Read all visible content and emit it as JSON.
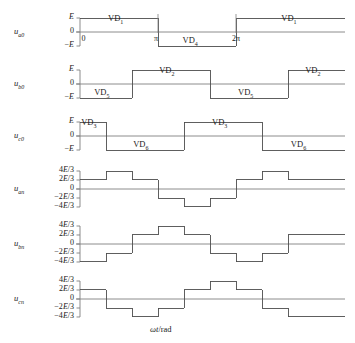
{
  "figure": {
    "xaxis_label": "ωt/rad",
    "xaxis_label_italic": "ωt",
    "xaxis_label_rest": "/rad",
    "x_ticks": [
      {
        "label": "0",
        "phase_deg": 0
      },
      {
        "label": "π",
        "phase_deg": 180
      },
      {
        "label": "2π",
        "phase_deg": 360
      }
    ],
    "geometry": {
      "x_origin_px": 80,
      "px_per_60deg": 26,
      "x_end_px": 345
    },
    "colors": {
      "trace": "#4d4d4d",
      "axis": "#808080",
      "text": "#1a1a1a",
      "background": "#ffffff"
    }
  },
  "chart_data": {
    "type": "line",
    "title": "",
    "xlabel": "ωt/rad",
    "ylabel": "",
    "grid": false,
    "legend": "none",
    "x_unit": "degrees",
    "x_range_deg": [
      0,
      612
    ],
    "plots": [
      {
        "name": "u_a0",
        "ylabel_base": "u",
        "ylabel_sub": "a0",
        "ytick_labels": [
          "E",
          "0",
          "−E"
        ],
        "ytick_values": [
          1,
          0,
          -1
        ],
        "ylim": [
          -1,
          1
        ],
        "unit": "E",
        "steps": [
          {
            "from_deg": 0,
            "to_deg": 180,
            "value": 1
          },
          {
            "from_deg": 180,
            "to_deg": 360,
            "value": -1
          },
          {
            "from_deg": 360,
            "to_deg": 612,
            "value": 1
          }
        ],
        "device_labels": [
          {
            "text": "VD",
            "sub": "1",
            "center_deg": 90,
            "level": "high"
          },
          {
            "text": "VD",
            "sub": "4",
            "center_deg": 262,
            "level": "low"
          },
          {
            "text": "VD",
            "sub": "1",
            "center_deg": 490,
            "level": "high"
          }
        ]
      },
      {
        "name": "u_b0",
        "ylabel_base": "u",
        "ylabel_sub": "b0",
        "ytick_labels": [
          "E",
          "0",
          "−E"
        ],
        "ytick_values": [
          1,
          0,
          -1
        ],
        "ylim": [
          -1,
          1
        ],
        "unit": "E",
        "steps": [
          {
            "from_deg": 0,
            "to_deg": 120,
            "value": -1
          },
          {
            "from_deg": 120,
            "to_deg": 300,
            "value": 1
          },
          {
            "from_deg": 300,
            "to_deg": 480,
            "value": -1
          },
          {
            "from_deg": 480,
            "to_deg": 612,
            "value": 1
          }
        ],
        "device_labels": [
          {
            "text": "VD",
            "sub": "5",
            "center_deg": 58,
            "level": "low"
          },
          {
            "text": "VD",
            "sub": "2",
            "center_deg": 208,
            "level": "high"
          },
          {
            "text": "VD",
            "sub": "5",
            "center_deg": 390,
            "level": "low"
          },
          {
            "text": "VD",
            "sub": "2",
            "center_deg": 545,
            "level": "high"
          }
        ]
      },
      {
        "name": "u_c0",
        "ylabel_base": "u",
        "ylabel_sub": "c0",
        "ytick_labels": [
          "E",
          "0",
          "−E"
        ],
        "ytick_values": [
          1,
          0,
          -1
        ],
        "ylim": [
          -1,
          1
        ],
        "unit": "E",
        "steps": [
          {
            "from_deg": 0,
            "to_deg": 60,
            "value": 1
          },
          {
            "from_deg": 60,
            "to_deg": 240,
            "value": -1
          },
          {
            "from_deg": 240,
            "to_deg": 420,
            "value": 1
          },
          {
            "from_deg": 420,
            "to_deg": 612,
            "value": -1
          }
        ],
        "device_labels": [
          {
            "text": "VD",
            "sub": "3",
            "center_deg": 28,
            "level": "high"
          },
          {
            "text": "VD",
            "sub": "6",
            "center_deg": 148,
            "level": "low"
          },
          {
            "text": "VD",
            "sub": "3",
            "center_deg": 330,
            "level": "high"
          },
          {
            "text": "VD",
            "sub": "6",
            "center_deg": 512,
            "level": "low"
          }
        ]
      },
      {
        "name": "u_an",
        "ylabel_base": "u",
        "ylabel_sub": "an",
        "ytick_labels": [
          "4E/3",
          "2E/3",
          "0",
          "−2E/3",
          "−4E/3"
        ],
        "ytick_values": [
          1.3333,
          0.6667,
          0,
          -0.6667,
          -1.3333
        ],
        "ylim": [
          -1.3333,
          1.3333
        ],
        "unit": "E",
        "steps": [
          {
            "from_deg": 0,
            "to_deg": 60,
            "value": 0.6667
          },
          {
            "from_deg": 60,
            "to_deg": 120,
            "value": 1.3333
          },
          {
            "from_deg": 120,
            "to_deg": 180,
            "value": 0.6667
          },
          {
            "from_deg": 180,
            "to_deg": 240,
            "value": -0.6667
          },
          {
            "from_deg": 240,
            "to_deg": 300,
            "value": -1.3333
          },
          {
            "from_deg": 300,
            "to_deg": 360,
            "value": -0.6667
          },
          {
            "from_deg": 360,
            "to_deg": 420,
            "value": 0.6667
          },
          {
            "from_deg": 420,
            "to_deg": 480,
            "value": 1.3333
          },
          {
            "from_deg": 480,
            "to_deg": 540,
            "value": 0.6667
          },
          {
            "from_deg": 540,
            "to_deg": 612,
            "value": 0.6667
          }
        ],
        "device_labels": []
      },
      {
        "name": "u_bn",
        "ylabel_base": "u",
        "ylabel_sub": "bn",
        "ytick_labels": [
          "4E/3",
          "2E/3",
          "0",
          "−2E/3",
          "−4E/3"
        ],
        "ytick_values": [
          1.3333,
          0.6667,
          0,
          -0.6667,
          -1.3333
        ],
        "ylim": [
          -1.3333,
          1.3333
        ],
        "unit": "E",
        "steps": [
          {
            "from_deg": 0,
            "to_deg": 60,
            "value": -1.3333
          },
          {
            "from_deg": 60,
            "to_deg": 120,
            "value": -0.6667
          },
          {
            "from_deg": 120,
            "to_deg": 180,
            "value": 0.6667
          },
          {
            "from_deg": 180,
            "to_deg": 240,
            "value": 1.3333
          },
          {
            "from_deg": 240,
            "to_deg": 300,
            "value": 0.6667
          },
          {
            "from_deg": 300,
            "to_deg": 360,
            "value": -0.6667
          },
          {
            "from_deg": 360,
            "to_deg": 420,
            "value": -1.3333
          },
          {
            "from_deg": 420,
            "to_deg": 480,
            "value": -0.6667
          },
          {
            "from_deg": 480,
            "to_deg": 612,
            "value": 0.6667
          }
        ],
        "device_labels": []
      },
      {
        "name": "u_cn",
        "ylabel_base": "u",
        "ylabel_sub": "cn",
        "ytick_labels": [
          "4E/3",
          "2E/3",
          "0",
          "−2E/3",
          "−4E/3"
        ],
        "ytick_values": [
          1.3333,
          0.6667,
          0,
          -0.6667,
          -1.3333
        ],
        "ylim": [
          -1.3333,
          1.3333
        ],
        "unit": "E",
        "steps": [
          {
            "from_deg": 0,
            "to_deg": 60,
            "value": 0.6667
          },
          {
            "from_deg": 60,
            "to_deg": 120,
            "value": -0.6667
          },
          {
            "from_deg": 120,
            "to_deg": 180,
            "value": -1.3333
          },
          {
            "from_deg": 180,
            "to_deg": 240,
            "value": -0.6667
          },
          {
            "from_deg": 240,
            "to_deg": 300,
            "value": 0.6667
          },
          {
            "from_deg": 300,
            "to_deg": 360,
            "value": 1.3333
          },
          {
            "from_deg": 360,
            "to_deg": 420,
            "value": 0.6667
          },
          {
            "from_deg": 420,
            "to_deg": 480,
            "value": -0.6667
          },
          {
            "from_deg": 480,
            "to_deg": 612,
            "value": -1.3333
          }
        ],
        "device_labels": []
      }
    ]
  }
}
